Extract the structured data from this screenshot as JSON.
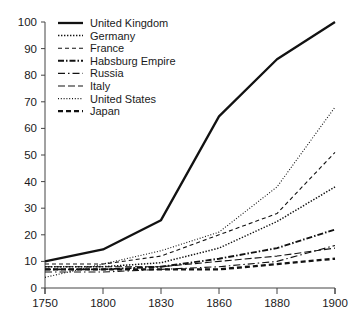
{
  "chart_data": {
    "type": "line",
    "title": "",
    "subtitle": "",
    "xlabel": "",
    "ylabel": "",
    "x": [
      1750,
      1800,
      1830,
      1860,
      1880,
      1900
    ],
    "x_tick_labels": [
      "1750",
      "1800",
      "1830",
      "1860",
      "1880",
      "1900"
    ],
    "x_scale": "categorical-evenly-spaced",
    "y_tick_labels": [
      "0",
      "10",
      "20",
      "30",
      "40",
      "50",
      "60",
      "70",
      "80",
      "90",
      "100"
    ],
    "y_ticks": [
      0,
      10,
      20,
      30,
      40,
      50,
      60,
      70,
      80,
      90,
      100
    ],
    "ylim": [
      0,
      100
    ],
    "grid": false,
    "legend_position": "top-left-inside",
    "series": [
      {
        "name": "United Kingdom",
        "values": [
          10,
          14.5,
          25.5,
          64.5,
          86,
          100
        ],
        "line_style": "solid",
        "dasharray": "",
        "width": 2.3
      },
      {
        "name": "Germany",
        "values": [
          8,
          8,
          9.5,
          15,
          25,
          38
        ],
        "line_style": "dotted",
        "dasharray": "1.4,1.6",
        "width": 1.5
      },
      {
        "name": "France",
        "values": [
          9,
          9,
          12,
          20,
          28,
          51
        ],
        "line_style": "dashed",
        "dasharray": "4,3",
        "width": 1.1
      },
      {
        "name": "Habsburg Empire",
        "values": [
          7,
          7,
          8,
          11,
          15,
          22
        ],
        "line_style": "dash-dot-dot",
        "dasharray": "6,2,1.5,2",
        "width": 1.9
      },
      {
        "name": "Russia",
        "values": [
          6,
          6,
          7,
          8,
          10,
          16
        ],
        "line_style": "dash-dot",
        "dasharray": "7,3,1.5,3",
        "width": 1.1
      },
      {
        "name": "Italy",
        "values": [
          8,
          8,
          8,
          10,
          12,
          15
        ],
        "line_style": "long-dash",
        "dasharray": "7,3",
        "width": 1.1
      },
      {
        "name": "United States",
        "values": [
          4,
          9,
          14,
          21,
          38,
          68
        ],
        "line_style": "fine-dotted",
        "dasharray": "1,1.8",
        "width": 1.1
      },
      {
        "name": "Japan",
        "values": [
          7,
          7,
          7,
          7,
          9,
          11
        ],
        "line_style": "bold-dash",
        "dasharray": "5,3",
        "width": 2.3
      }
    ]
  },
  "colors": {
    "ink": "#121212",
    "axis": "#444444",
    "background": "#ffffff"
  }
}
